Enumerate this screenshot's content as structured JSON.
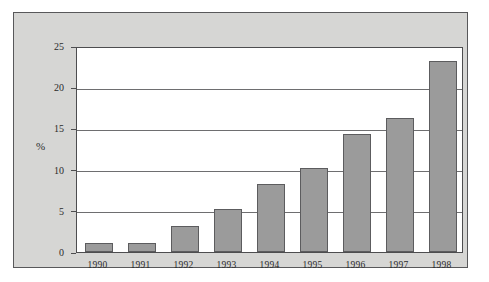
{
  "chart_data": {
    "type": "bar",
    "title": "",
    "xlabel": "",
    "ylabel": "%",
    "categories": [
      "1990",
      "1991",
      "1992",
      "1993",
      "1994",
      "1995",
      "1996",
      "1997",
      "1998"
    ],
    "values": [
      1.1,
      1.1,
      3.2,
      5.2,
      8.2,
      10.2,
      14.3,
      16.3,
      23.2
    ],
    "ylim": [
      0,
      25
    ],
    "yticks": [
      0,
      5,
      10,
      15,
      20,
      25
    ],
    "ytick_labels": [
      "0",
      "5",
      "10",
      "15",
      "20",
      "25"
    ],
    "grid": true,
    "legend": false,
    "legend_position": "none",
    "colors": {
      "bar_fill": "#9b9b9b",
      "bar_border": "#5c5c5e",
      "panel_background": "#d6d6d4",
      "panel_border": "#58585a",
      "plot_background": "#ffffff",
      "gridline": "#6e6e70",
      "text": "#2b2b2b"
    }
  }
}
